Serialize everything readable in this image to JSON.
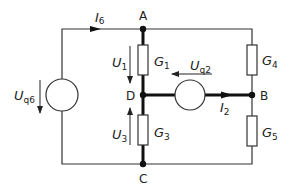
{
  "nodes": {
    "A": "A",
    "B": "B",
    "C": "C",
    "D": "D"
  },
  "elements": {
    "G1": {
      "symbol": "G",
      "sub": "1"
    },
    "G3": {
      "symbol": "G",
      "sub": "3"
    },
    "G4": {
      "symbol": "G",
      "sub": "4"
    },
    "G5": {
      "symbol": "G",
      "sub": "5"
    }
  },
  "sources": {
    "Uq6": {
      "symbol": "U",
      "sub": "q6"
    },
    "Uq2": {
      "symbol": "U",
      "sub": "q2"
    }
  },
  "voltages": {
    "U1": {
      "symbol": "U",
      "sub": "1"
    },
    "U3": {
      "symbol": "U",
      "sub": "3"
    }
  },
  "currents": {
    "I6": {
      "symbol": "I",
      "sub": "6"
    },
    "I2": {
      "symbol": "I",
      "sub": "2"
    }
  },
  "colors": {
    "line": "#222222",
    "background": "#ffffff"
  }
}
